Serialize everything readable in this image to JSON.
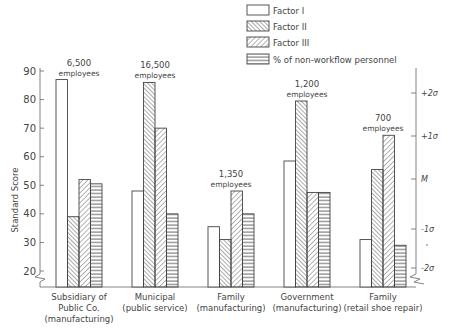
{
  "chart_data": {
    "type": "bar",
    "title": "",
    "xlabel": "",
    "ylabel": "Standard Score",
    "ylim": [
      15,
      92
    ],
    "y_ticks": [
      20,
      30,
      40,
      50,
      60,
      70,
      80,
      90
    ],
    "right_axis": {
      "ticks": [
        "+2σ",
        "+1σ",
        "M",
        "-1σ",
        "-2σ"
      ]
    },
    "grid": false,
    "legend_position": "top-right",
    "categories": [
      [
        "Subsidiary of",
        "Public Co.",
        "(manufacturing)"
      ],
      [
        "Municipal",
        "(public service)"
      ],
      [
        "Family",
        "(manufacturing)"
      ],
      [
        "Government",
        "(manufacturing)"
      ],
      [
        "Family",
        "(retail shoe repair)"
      ]
    ],
    "annotations": [
      [
        "6,500",
        "employees"
      ],
      [
        "16,500",
        "employees"
      ],
      [
        "1,350",
        "employees"
      ],
      [
        "1,200",
        "employees"
      ],
      [
        "700",
        "employees"
      ]
    ],
    "series": [
      {
        "name": "Factor I",
        "pattern": "empty",
        "values": [
          87,
          48,
          35.5,
          58.5,
          31
        ]
      },
      {
        "name": "Factor II",
        "pattern": "back-diagonal",
        "values": [
          39,
          86,
          31,
          79.5,
          55.5
        ]
      },
      {
        "name": "Factor III",
        "pattern": "forward-diagonal",
        "values": [
          52,
          70,
          48,
          47.5,
          67.5
        ]
      },
      {
        "name": "% of non-workflow personnel",
        "pattern": "horizontal",
        "values": [
          50.5,
          40,
          40,
          47.5,
          29
        ]
      }
    ]
  },
  "legend": {
    "items": [
      "Factor I",
      "Factor II",
      "Factor III",
      "% of non-workflow personnel"
    ]
  }
}
